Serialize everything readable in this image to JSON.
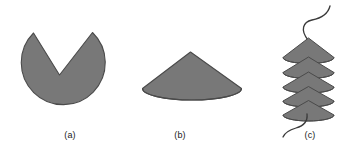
{
  "figure": {
    "background_color": "#ffffff",
    "shape_fill_color": "#787878",
    "shape_stroke_color": "#4a4a4a",
    "curve_color": "#3a3a3a",
    "caption_color": "#1a1a1a",
    "panels": [
      {
        "id": "a",
        "caption": "(a)",
        "shape_name": "circle-with-v-notch",
        "description": "Filled circle with a V-shaped wedge removed from the top"
      },
      {
        "id": "b",
        "caption": "(b)",
        "shape_name": "cone",
        "description": "Filled cone seen in perspective with elliptical base"
      },
      {
        "id": "c",
        "caption": "(c)",
        "shape_name": "stacked-cones-with-helix",
        "description": "Vertical stack of five cones threaded by a wavy curve entering at the top apex and exiting at the bottom",
        "cone_count": 5
      }
    ]
  }
}
